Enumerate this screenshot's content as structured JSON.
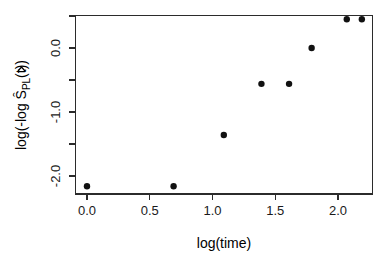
{
  "chart_data": {
    "type": "scatter",
    "title": "",
    "xlabel": "log(time)",
    "ylabel": "log(-log Ŝ",
    "ylabel_sub": "PL",
    "ylabel_tail": "(t))",
    "xlim": [
      -0.1,
      2.3
    ],
    "ylim": [
      -2.45,
      0.62
    ],
    "grid": false,
    "legend": null,
    "xticks": [
      0.0,
      0.5,
      1.0,
      1.5,
      2.0
    ],
    "xtick_labels": [
      "0.0",
      "0.5",
      "1.0",
      "1.5",
      "2.0"
    ],
    "yticks": [
      0.0,
      -1.0,
      -2.0
    ],
    "ytick_labels": [
      "0.0",
      "-1.0",
      "-2.0"
    ],
    "x": [
      0.0,
      0.69,
      1.09,
      1.39,
      1.61,
      1.79,
      2.07,
      2.19
    ],
    "y": [
      -2.16,
      -2.16,
      -1.36,
      -0.56,
      -0.56,
      0.0,
      0.45,
      0.45
    ],
    "marker": "filled-circle",
    "marker_color": "#111111",
    "marker_size": 3.2
  },
  "axes": {
    "frame_color": "#2b2b2b",
    "background": "#ffffff"
  }
}
